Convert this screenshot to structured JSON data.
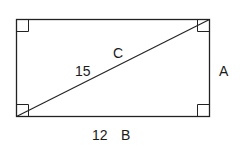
{
  "diagram": {
    "shape": "rectangle",
    "diagonal_label_value": "15",
    "diagonal_label_letter": "C",
    "right_side_label": "A",
    "bottom_label_value": "12",
    "bottom_label_letter": "B",
    "right_angle_markers": 4,
    "stroke_color": "#222222"
  }
}
